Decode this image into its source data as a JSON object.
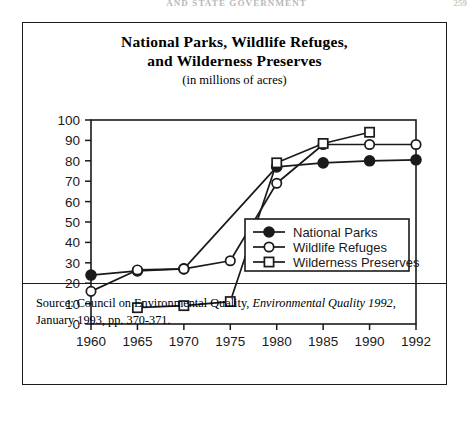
{
  "page": {
    "running_head": "AND STATE GOVERNMENT",
    "page_number": "259"
  },
  "figure": {
    "title_line1": "National  Parks, Wildlife Refuges,",
    "title_line2": "and Wilderness Preserves",
    "subtitle": "(in millions of acres)",
    "source_prefix": "Source: Council on Environmental Quality, ",
    "source_italic": "Environmental Quality 1992",
    "source_suffix": ",",
    "source_line2": "January 1993, pp. 370-371."
  },
  "chart_data": {
    "type": "line",
    "title": "National  Parks, Wildlife Refuges, and Wilderness Preserves",
    "subtitle": "(in millions of acres)",
    "xlabel": "",
    "ylabel": "",
    "ylim": [
      0,
      100
    ],
    "ytick_step": 10,
    "yticks": [
      "0",
      "10",
      "20",
      "30",
      "40",
      "50",
      "60",
      "70",
      "80",
      "90",
      "100"
    ],
    "categories": [
      "1960",
      "1965",
      "1970",
      "1975",
      "1980",
      "1985",
      "1990",
      "1992"
    ],
    "grid": false,
    "legend_position": "inside-right",
    "series": [
      {
        "name": "National Parks",
        "marker": "filled-circle",
        "values": [
          24,
          26,
          27,
          null,
          77,
          79,
          80,
          80.5
        ]
      },
      {
        "name": "Wildlife Refuges",
        "marker": "open-circle",
        "values": [
          16,
          26.5,
          27,
          31,
          69,
          88,
          88,
          88
        ]
      },
      {
        "name": "Wilderness Preserves",
        "marker": "open-square",
        "values": [
          null,
          8,
          9,
          11,
          79,
          88.5,
          94,
          null
        ]
      }
    ]
  }
}
